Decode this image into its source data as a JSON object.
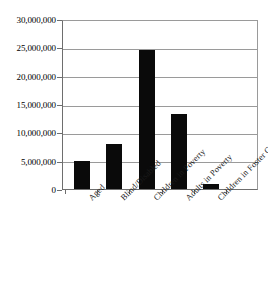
{
  "chart_data": {
    "type": "bar",
    "title": "",
    "subtitle": "",
    "xlabel": "",
    "ylabel": "",
    "categories": [
      "Aged",
      "Blind/Disabled",
      "Children in Poverty",
      "Adults in Poverty",
      "Children in Foster Care"
    ],
    "values": [
      4900000,
      8000000,
      24600000,
      13300000,
      800000
    ],
    "ylim": [
      0,
      30000000
    ],
    "ytick_values": [
      0,
      5000000,
      10000000,
      15000000,
      20000000,
      25000000,
      30000000
    ],
    "ytick_labels": [
      "0",
      "5,000,000",
      "10,000,000",
      "15,000,000",
      "20,000,000",
      "25,000,000",
      "30,000,000"
    ],
    "grid": true,
    "grid_orientation": "horizontal",
    "legend": false,
    "legend_position": "none",
    "bar_color": "#0a0a0a",
    "grid_color": "#9a9a9a",
    "axis_color": "#6e6e6e",
    "background_color": "#ffffff",
    "xtick_label_rotation": -45
  }
}
